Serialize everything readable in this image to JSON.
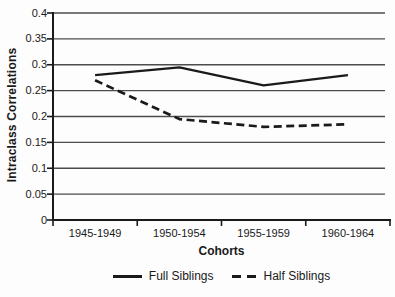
{
  "chart_data": {
    "type": "line",
    "title": "",
    "categories": [
      "1945-1949",
      "1950-1954",
      "1955-1959",
      "1960-1964"
    ],
    "series": [
      {
        "name": "Full Siblings",
        "style": "solid",
        "values": [
          0.28,
          0.295,
          0.26,
          0.28
        ]
      },
      {
        "name": "Half Siblings",
        "style": "dashed",
        "values": [
          0.27,
          0.195,
          0.18,
          0.185
        ]
      }
    ],
    "xlabel": "Cohorts",
    "ylabel": "Intraclass Correlations",
    "ylim": [
      0,
      0.4
    ],
    "ytick_step": 0.05,
    "ytick_labels": [
      "0",
      "0.05",
      "0.1",
      "0.15",
      "0.2",
      "0.25",
      "0.3",
      "0.35",
      "0.4"
    ],
    "grid": true,
    "legend_position": "bottom-center"
  },
  "colors": {
    "line": "#1a1a1a",
    "grid": "#4d4d4d",
    "axis": "#1a1a1a",
    "text": "#1a1a1a",
    "background": "#fdfdfd"
  }
}
